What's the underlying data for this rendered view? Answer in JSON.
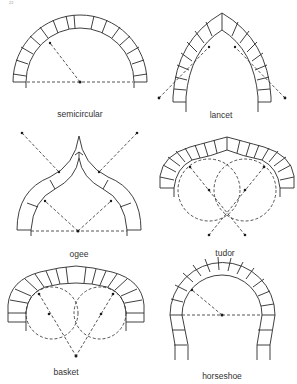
{
  "page_number": "22",
  "arches": [
    {
      "id": "semicircular",
      "label": "semicircular"
    },
    {
      "id": "lancet",
      "label": "lancet"
    },
    {
      "id": "ogee",
      "label": "ogee"
    },
    {
      "id": "tudor",
      "label": "tudor"
    },
    {
      "id": "basket",
      "label": "basket"
    },
    {
      "id": "horseshoe",
      "label": "horseshoe"
    }
  ],
  "colors": {
    "line": "#2a2a2a",
    "background": "#ffffff"
  }
}
